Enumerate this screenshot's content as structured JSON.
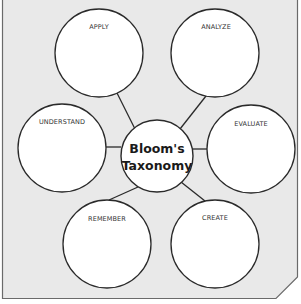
{
  "diagram": {
    "title": "Bloom's Taxonomy",
    "center": {
      "line1": "Bloom's",
      "line2": "Taxonomy"
    },
    "nodes": [
      {
        "label": "APPLY"
      },
      {
        "label": "ANALYZE"
      },
      {
        "label": "UNDERSTAND"
      },
      {
        "label": "EVALUATE"
      },
      {
        "label": "REMEMBER"
      },
      {
        "label": "CREATE"
      }
    ]
  },
  "colors": {
    "background": "#e9e9e9",
    "frame": "#555555",
    "circle_fill": "#ffffff",
    "circle_stroke": "#2a2a2a",
    "connector": "#2a2a2a"
  }
}
